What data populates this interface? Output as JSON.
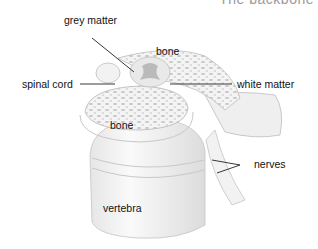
{
  "diagram": {
    "caption": "The backbone",
    "labels": {
      "grey_matter": "grey matter",
      "bone_top": "bone",
      "spinal_cord": "spinal cord",
      "white_matter": "white matter",
      "bone_middle": "bone",
      "nerves": "nerves",
      "vertebra": "vertebra"
    },
    "colors": {
      "background": "#ffffff",
      "label_text": "#111111",
      "leader_line": "#222222",
      "bone_shading": "#d8d8d8",
      "outline": "#b5b5b5"
    }
  }
}
